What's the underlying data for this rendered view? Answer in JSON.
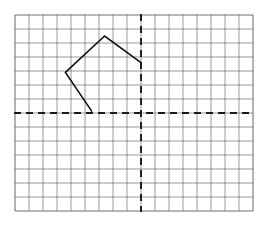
{
  "figure": {
    "title": ""
  },
  "chart_data": {
    "type": "scatter",
    "title": "",
    "subtitle": "",
    "xlabel": "",
    "ylabel": "",
    "grid": true,
    "legend": false,
    "legend_position": "none",
    "background_color": "#ffffff",
    "grid_color": "#5a5a5a",
    "axis_color": "#1a1a1a",
    "shape_color": "#111111",
    "cell_size_px": 14,
    "grid_columns": 17,
    "grid_rows": 14,
    "grid_left_px": 15,
    "grid_top_px": 15,
    "origin_col": 9,
    "origin_row": 7,
    "xlim": [
      -9,
      8
    ],
    "ylim": [
      -7,
      7
    ],
    "x_ticks": [
      -9,
      -8,
      -7,
      -6,
      -5,
      -4,
      -3,
      -2,
      -1,
      0,
      1,
      2,
      3,
      4,
      5,
      6,
      7,
      8
    ],
    "y_ticks": [
      -7,
      -6,
      -5,
      -4,
      -3,
      -2,
      -1,
      0,
      1,
      2,
      3,
      4,
      5,
      6,
      7
    ],
    "axes_style": "dashed",
    "series": [
      {
        "name": "polygon",
        "closed": false,
        "stroke": "#111111",
        "stroke_width": 1.6,
        "points": [
          {
            "x": -3.5,
            "y": 0.1,
            "label": "bottom-vertex"
          },
          {
            "x": -5.4,
            "y": 2.9,
            "label": "left-vertex"
          },
          {
            "x": -2.6,
            "y": 5.5,
            "label": "apex-vertex"
          },
          {
            "x": 0.0,
            "y": 3.6,
            "label": "right-vertex"
          }
        ]
      }
    ],
    "annotations": []
  }
}
